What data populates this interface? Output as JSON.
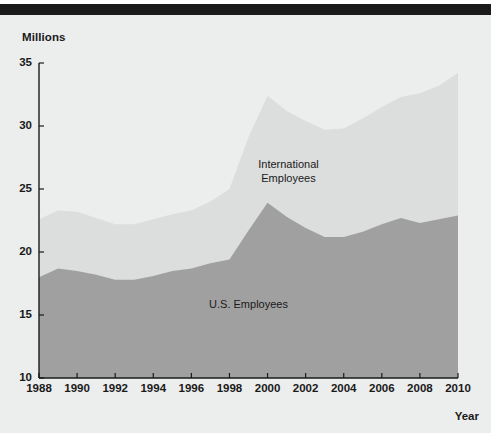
{
  "figure": {
    "background_color": "#eceded",
    "rule_color": "#1a1a1a"
  },
  "axes": {
    "y_unit_label": "Millions",
    "x_axis_title": "Year",
    "y_ticks": [
      10,
      15,
      20,
      25,
      30,
      35
    ],
    "x_ticks": [
      1988,
      1990,
      1992,
      1994,
      1996,
      1998,
      2000,
      2002,
      2004,
      2006,
      2008,
      2010
    ]
  },
  "annotations": {
    "international": "International\nEmployees",
    "international_line1": "International",
    "international_line2": "Employees",
    "us": "U.S. Employees"
  },
  "colors": {
    "us_employees": "#a0a0a0",
    "international_employees": "#dcdddd",
    "axis": "#1a1a1a",
    "text": "#1a1a1a"
  },
  "chart_data": {
    "type": "area",
    "stacked": true,
    "title": "",
    "xlabel": "Year",
    "ylabel": "Millions",
    "xlim": [
      1988,
      2010
    ],
    "ylim": [
      10,
      35
    ],
    "grid": false,
    "legend": "in-plot annotations",
    "x": [
      1988,
      1989,
      1990,
      1991,
      1992,
      1993,
      1994,
      1995,
      1996,
      1997,
      1998,
      1999,
      2000,
      2001,
      2002,
      2003,
      2004,
      2005,
      2006,
      2007,
      2008,
      2009,
      2010
    ],
    "series": [
      {
        "name": "U.S. Employees",
        "color": "#a0a0a0",
        "values": [
          18.0,
          18.7,
          18.5,
          18.2,
          17.8,
          17.8,
          18.1,
          18.5,
          18.7,
          19.1,
          19.4,
          21.7,
          23.9,
          22.8,
          21.9,
          21.2,
          21.2,
          21.6,
          22.2,
          22.7,
          22.3,
          22.6,
          22.9
        ]
      },
      {
        "name": "International Employees",
        "color": "#dcdddd",
        "values": [
          4.6,
          4.6,
          4.7,
          4.5,
          4.4,
          4.4,
          4.5,
          4.5,
          4.6,
          4.9,
          5.6,
          7.4,
          8.5,
          8.4,
          8.5,
          8.5,
          8.6,
          9.0,
          9.3,
          9.6,
          10.3,
          10.6,
          11.3
        ]
      }
    ],
    "totals": [
      22.6,
      23.3,
      23.2,
      22.7,
      22.2,
      22.2,
      22.6,
      23.0,
      23.3,
      24.0,
      25.0,
      29.1,
      32.4,
      31.2,
      30.4,
      29.7,
      29.8,
      30.6,
      31.5,
      32.3,
      32.6,
      33.2,
      34.2
    ]
  }
}
